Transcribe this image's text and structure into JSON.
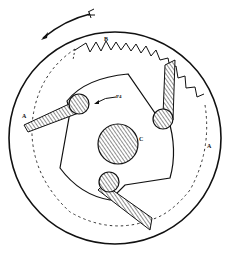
{
  "diagram": {
    "type": "mechanical-ratchet-clutch",
    "colors": {
      "line": "#111111",
      "hatch": "#555555",
      "background": "#ffffff"
    },
    "labels": {
      "spring": "B",
      "track_left": "A",
      "track_right": "A",
      "hub": "C",
      "pawl_motion": "P4"
    },
    "rotation_direction": "counter-clockwise",
    "components": [
      {
        "name": "outer-ring"
      },
      {
        "name": "spring-B"
      },
      {
        "name": "dashed-track-A"
      },
      {
        "name": "cam-body"
      },
      {
        "name": "hub-C"
      },
      {
        "name": "pawl-left"
      },
      {
        "name": "pawl-top-right"
      },
      {
        "name": "pawl-bottom"
      },
      {
        "name": "rotation-arrow"
      }
    ]
  }
}
